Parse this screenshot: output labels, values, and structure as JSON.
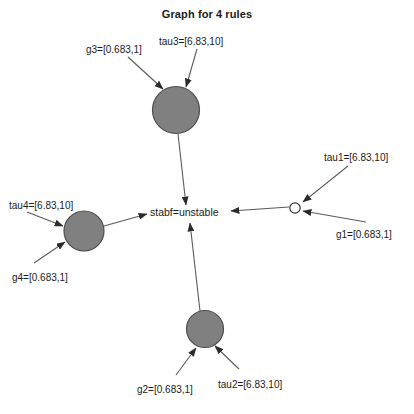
{
  "title": "Graph for 4 rules",
  "colors": {
    "node_fill": "#808080",
    "node_stroke": "#4d4d4d",
    "terminal_fill": "#ffffff",
    "terminal_stroke": "#333333",
    "edge": "#5a5a5a",
    "text": "#1a1a1a",
    "background": "#ffffff"
  },
  "center_node": {
    "label": "stabf=unstable"
  },
  "rule_nodes": [
    {
      "id": "rule3",
      "kind": "filled-circle",
      "cx": 176,
      "cy": 110,
      "r": 23.5,
      "inputs": [
        {
          "id": "g3",
          "label": "g3=[0.683,1]",
          "label_x": 86,
          "label_y": 44,
          "x1": 128,
          "y1": 57,
          "x2": 163,
          "y2": 89
        },
        {
          "id": "tau3",
          "label": "tau3=[6.83,10]",
          "label_x": 159,
          "label_y": 36,
          "x1": 197,
          "y1": 49,
          "x2": 186,
          "y2": 87
        }
      ],
      "output": {
        "x1": 178,
        "y1": 134,
        "x2": 186,
        "y2": 205
      }
    },
    {
      "id": "rule4",
      "kind": "filled-circle",
      "cx": 84,
      "cy": 231,
      "r": 20,
      "inputs": [
        {
          "id": "tau4",
          "label": "tau4=[6.83,10]",
          "label_x": 9,
          "label_y": 200,
          "x1": 27,
          "y1": 212,
          "x2": 63,
          "y2": 226
        },
        {
          "id": "g4",
          "label": "g4=[0.683,1]",
          "label_x": 12,
          "label_y": 272,
          "x1": 34,
          "y1": 263,
          "x2": 65,
          "y2": 242
        }
      ],
      "output": {
        "x1": 104,
        "y1": 226,
        "x2": 147,
        "y2": 214
      }
    },
    {
      "id": "rule2",
      "kind": "filled-circle",
      "cx": 205,
      "cy": 329,
      "r": 18.5,
      "inputs": [
        {
          "id": "g2",
          "label": "g2=[0.683,1]",
          "label_x": 137,
          "label_y": 384,
          "x1": 176,
          "y1": 375,
          "x2": 196,
          "y2": 348
        },
        {
          "id": "tau2",
          "label": "tau2=[6.83,10]",
          "label_x": 218,
          "label_y": 379,
          "x1": 239,
          "y1": 369,
          "x2": 215,
          "y2": 346
        }
      ],
      "output": {
        "x1": 200,
        "y1": 311,
        "x2": 190,
        "y2": 223
      }
    },
    {
      "id": "rule1",
      "kind": "open-circle",
      "cx": 295,
      "cy": 208,
      "r": 5.2,
      "inputs": [
        {
          "id": "tau1",
          "label": "tau1=[6.83,10]",
          "label_x": 324,
          "label_y": 152,
          "x1": 348,
          "y1": 166,
          "x2": 303,
          "y2": 202
        },
        {
          "id": "g1",
          "label": "g1=[0.683,1]",
          "label_x": 336,
          "label_y": 229,
          "x1": 366,
          "y1": 222,
          "x2": 303,
          "y2": 211
        }
      ],
      "output": {
        "x1": 289,
        "y1": 207,
        "x2": 231,
        "y2": 211
      }
    }
  ]
}
